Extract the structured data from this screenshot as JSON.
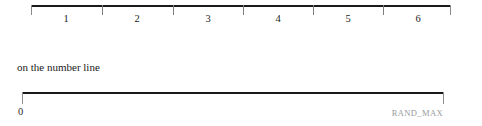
{
  "figure": {
    "caption": "on the number line",
    "top_axis": {
      "name": "integer-number-line",
      "tick_labels": [
        "1",
        "2",
        "3",
        "4",
        "5",
        "6"
      ],
      "tick_positions_px": [
        31,
        102,
        173,
        243,
        313,
        383,
        450
      ],
      "label_positions_px": [
        66,
        137,
        208,
        278,
        348,
        418
      ],
      "line_color": "#1a1a1a",
      "tick_color": "#7d7d7d",
      "label_color": "#1c1c1c"
    },
    "bottom_axis": {
      "name": "rand-max-number-line",
      "start_label": "0",
      "end_label": "RAND_MAX",
      "line_color": "#1a1a1a",
      "tick_color": "#8e8e8e",
      "start_label_color": "#2a2a2a",
      "end_label_color": "#9a9a9a"
    },
    "background_color": "#ffffff"
  }
}
